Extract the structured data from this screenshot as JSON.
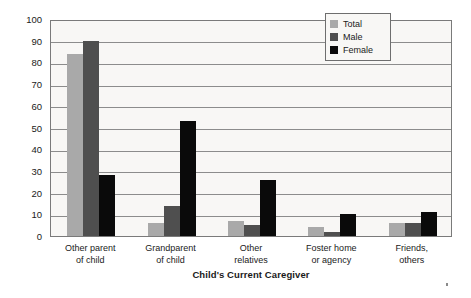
{
  "chart_data": {
    "type": "bar",
    "title": "",
    "xlabel": "Child's Current Caregiver",
    "ylabel": "Percentage of Children",
    "ylim": [
      0,
      100
    ],
    "yticks": [
      0,
      10,
      20,
      30,
      40,
      50,
      60,
      70,
      80,
      90,
      100
    ],
    "grid": true,
    "legend_position": "top-right",
    "categories": [
      "Other parent\nof child",
      "Grandparent\nof child",
      "Other\nrelatives",
      "Foster home\nor agency",
      "Friends,\nothers"
    ],
    "category_lines": [
      [
        "Other parent",
        "of child"
      ],
      [
        "Grandparent",
        "of child"
      ],
      [
        "Other",
        "relatives"
      ],
      [
        "Foster home",
        "or agency"
      ],
      [
        "Friends,",
        "others"
      ]
    ],
    "series": [
      {
        "name": "Total",
        "color": "#a9a9a9",
        "values": [
          84,
          6,
          7,
          4,
          6
        ]
      },
      {
        "name": "Male",
        "color": "#4f4f4f",
        "values": [
          90,
          14,
          5,
          2,
          6
        ]
      },
      {
        "name": "Female",
        "color": "#0a0a0a",
        "values": [
          28,
          53,
          26,
          10,
          11
        ]
      }
    ]
  }
}
